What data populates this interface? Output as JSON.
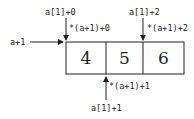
{
  "array": {
    "cells": [
      "4",
      "5",
      "6"
    ]
  },
  "labels": {
    "row_pointer": "a+1",
    "top_left": "a[1]+0",
    "top_left_deref": "*(a+1)+0",
    "top_right": "a[1]+2",
    "top_right_deref": "*(a+1)+2",
    "bottom": "a[1]+1",
    "bottom_deref": "*(a+1)+1"
  },
  "colors": {
    "stroke": "#222222",
    "background": "#ffffff"
  }
}
